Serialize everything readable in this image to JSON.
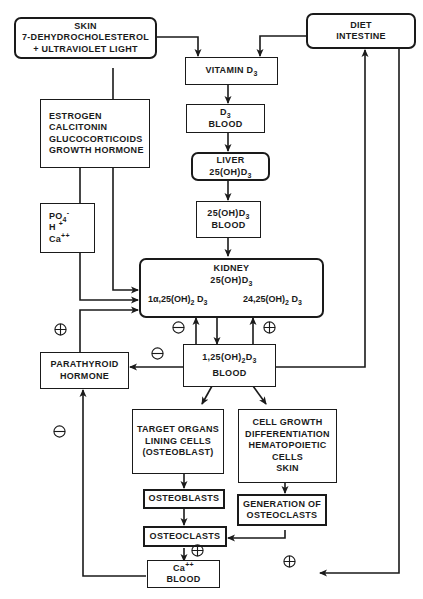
{
  "diagram": {
    "nodes": {
      "skin": {
        "lines": [
          "SKIN",
          "7-DEHYDROCHOLESTEROL",
          "+ ULTRAVIOLET  LIGHT"
        ]
      },
      "diet": {
        "lines": [
          "DIET",
          "INTESTINE"
        ]
      },
      "vitamin_d3": {
        "label": "VITAMIN  D",
        "sub": "3"
      },
      "d3_blood": {
        "label": "D",
        "sub": "3",
        "line2": "BLOOD"
      },
      "regulators": {
        "lines": [
          "ESTROGEN",
          "CALCITONIN",
          "GLUCOCORTICOIDS",
          "GROWTH HORMONE"
        ]
      },
      "liver": {
        "line1": "LIVER",
        "line2": "25(OH)D",
        "sub": "3"
      },
      "ions": {
        "po4": "PO",
        "po4_sub": "4",
        "po4_sup": "-",
        "h": "H",
        "h_sup": "+",
        "ca": "Ca",
        "ca_sup": "++"
      },
      "ohd3_blood": {
        "line1": "25(OH)D",
        "sub": "3",
        "line2": "BLOOD"
      },
      "kidney": {
        "line1": "KIDNEY",
        "line2": "25(OH)D",
        "sub": "3",
        "left_product": "1α,25(OH)",
        "left_sub1": "2",
        "left_mid": " D",
        "left_sub2": "3",
        "right_product": "24,25(OH)",
        "right_sub1": "2",
        "right_mid": " D",
        "right_sub2": "3"
      },
      "parathyroid": {
        "lines": [
          "PARATHYROID",
          "HORMONE"
        ]
      },
      "calcitriol_blood": {
        "line1": "1,25(OH)",
        "sub1": "2",
        "mid": "D",
        "sub2": "3",
        "line2": "BLOOD"
      },
      "target_organs": {
        "lines": [
          "TARGET ORGANS",
          "LINING CELLS",
          "(OSTEOBLAST)"
        ]
      },
      "cell_growth": {
        "lines": [
          "CELL GROWTH",
          "DIFFERENTIATION",
          "HEMATOPOIETIC",
          "CELLS",
          "SKIN"
        ]
      },
      "osteoblasts": {
        "label": "OSTEOBLASTS"
      },
      "generation_osteoclasts": {
        "lines": [
          "GENERATION OF",
          "OSTEOCLASTS"
        ]
      },
      "osteoclasts": {
        "label": "OSTEOCLASTS"
      },
      "ca_blood": {
        "line1": "Ca",
        "sup": "++",
        "line2": "BLOOD"
      }
    },
    "signs": {
      "plus": "⊕",
      "minus": "⊖"
    }
  }
}
